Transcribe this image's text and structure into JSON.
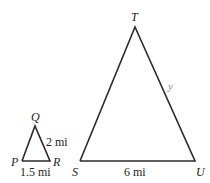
{
  "figure": {
    "type": "similar-triangles",
    "small_triangle": {
      "vertices": {
        "P": "P",
        "Q": "Q",
        "R": "R"
      },
      "sides": {
        "QR": "2 mi",
        "PR": "1.5 mi"
      }
    },
    "large_triangle": {
      "vertices": {
        "S": "S",
        "T": "T",
        "U": "U"
      },
      "sides": {
        "TU": "y",
        "SU": "6 mi"
      }
    },
    "colors": {
      "stroke": "#2a2a2a",
      "variable_label": "#8a8a8a"
    }
  }
}
